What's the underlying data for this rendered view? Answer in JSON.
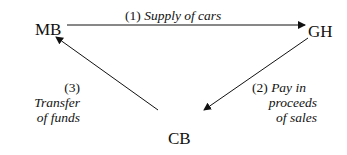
{
  "nodes": {
    "mb": "MB",
    "gh": "GH",
    "cb": "CB"
  },
  "edges": [
    {
      "from": "MB",
      "to": "GH",
      "number": "(1)",
      "label": "Supply of cars"
    },
    {
      "from": "GH",
      "to": "CB",
      "number": "(2)",
      "label_lines": [
        "Pay in",
        "proceeds",
        "of sales"
      ]
    },
    {
      "from": "CB",
      "to": "MB",
      "number": "(3)",
      "label_lines": [
        "Transfer",
        "of funds"
      ]
    }
  ]
}
